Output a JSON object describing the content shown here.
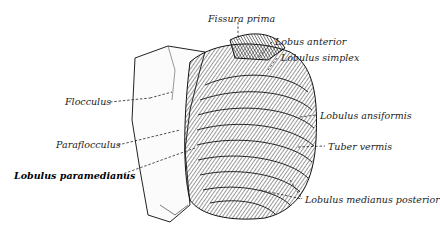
{
  "figure": {
    "labels": {
      "fissura_prima": "Fissura prima",
      "lobus_anterior": "Lobus anterior",
      "lobulus_simplex": "Lobulus simplex",
      "flocculus": "Flocculus",
      "lobulus_ansiformis": "Lobulus ansiformis",
      "paraflocculus": "Paraflocculus",
      "tuber_vermis": "Tuber vermis",
      "lobulus_paramedianus": "Lobulus paramedianus",
      "lobulus_medianus_posterior": "Lobulus medianus posterior"
    }
  }
}
